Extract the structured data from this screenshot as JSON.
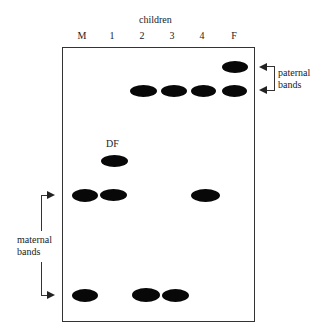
{
  "figure": {
    "title": "children",
    "lanes": [
      "M",
      "1",
      "2",
      "3",
      "4",
      "F"
    ],
    "annotation_df": "DF",
    "paternal_label": [
      "paternal",
      "bands"
    ],
    "maternal_label": [
      "maternal",
      "bands"
    ]
  },
  "bands": [
    {
      "lane": "F",
      "row": "paternal-top"
    },
    {
      "lane": "2",
      "row": "paternal-common"
    },
    {
      "lane": "3",
      "row": "paternal-common"
    },
    {
      "lane": "4",
      "row": "paternal-common"
    },
    {
      "lane": "F",
      "row": "paternal-common"
    },
    {
      "lane": "1",
      "row": "DF"
    },
    {
      "lane": "M",
      "row": "maternal-top"
    },
    {
      "lane": "1",
      "row": "maternal-top"
    },
    {
      "lane": "4",
      "row": "maternal-top"
    },
    {
      "lane": "M",
      "row": "maternal-bottom"
    },
    {
      "lane": "2",
      "row": "maternal-bottom"
    },
    {
      "lane": "3",
      "row": "maternal-bottom"
    }
  ]
}
